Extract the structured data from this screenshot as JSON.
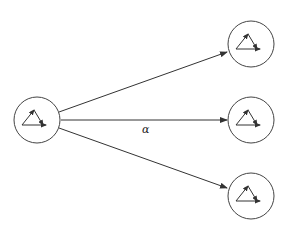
{
  "diagram": {
    "edge_label": "α",
    "colors": {
      "stroke": "#333333",
      "background": "#ffffff"
    },
    "nodes": [
      {
        "id": "source",
        "cx": 37,
        "cy": 120,
        "r": 23
      },
      {
        "id": "target-top",
        "cx": 251,
        "cy": 44,
        "r": 23
      },
      {
        "id": "target-middle",
        "cx": 251,
        "cy": 120,
        "r": 23
      },
      {
        "id": "target-bottom",
        "cx": 251,
        "cy": 196,
        "r": 23
      }
    ],
    "edges": [
      {
        "from": "source",
        "to": "target-top"
      },
      {
        "from": "source",
        "to": "target-middle",
        "label": "α"
      },
      {
        "from": "source",
        "to": "target-bottom"
      }
    ],
    "node_icon": "triangle-of-vectors-icon"
  }
}
